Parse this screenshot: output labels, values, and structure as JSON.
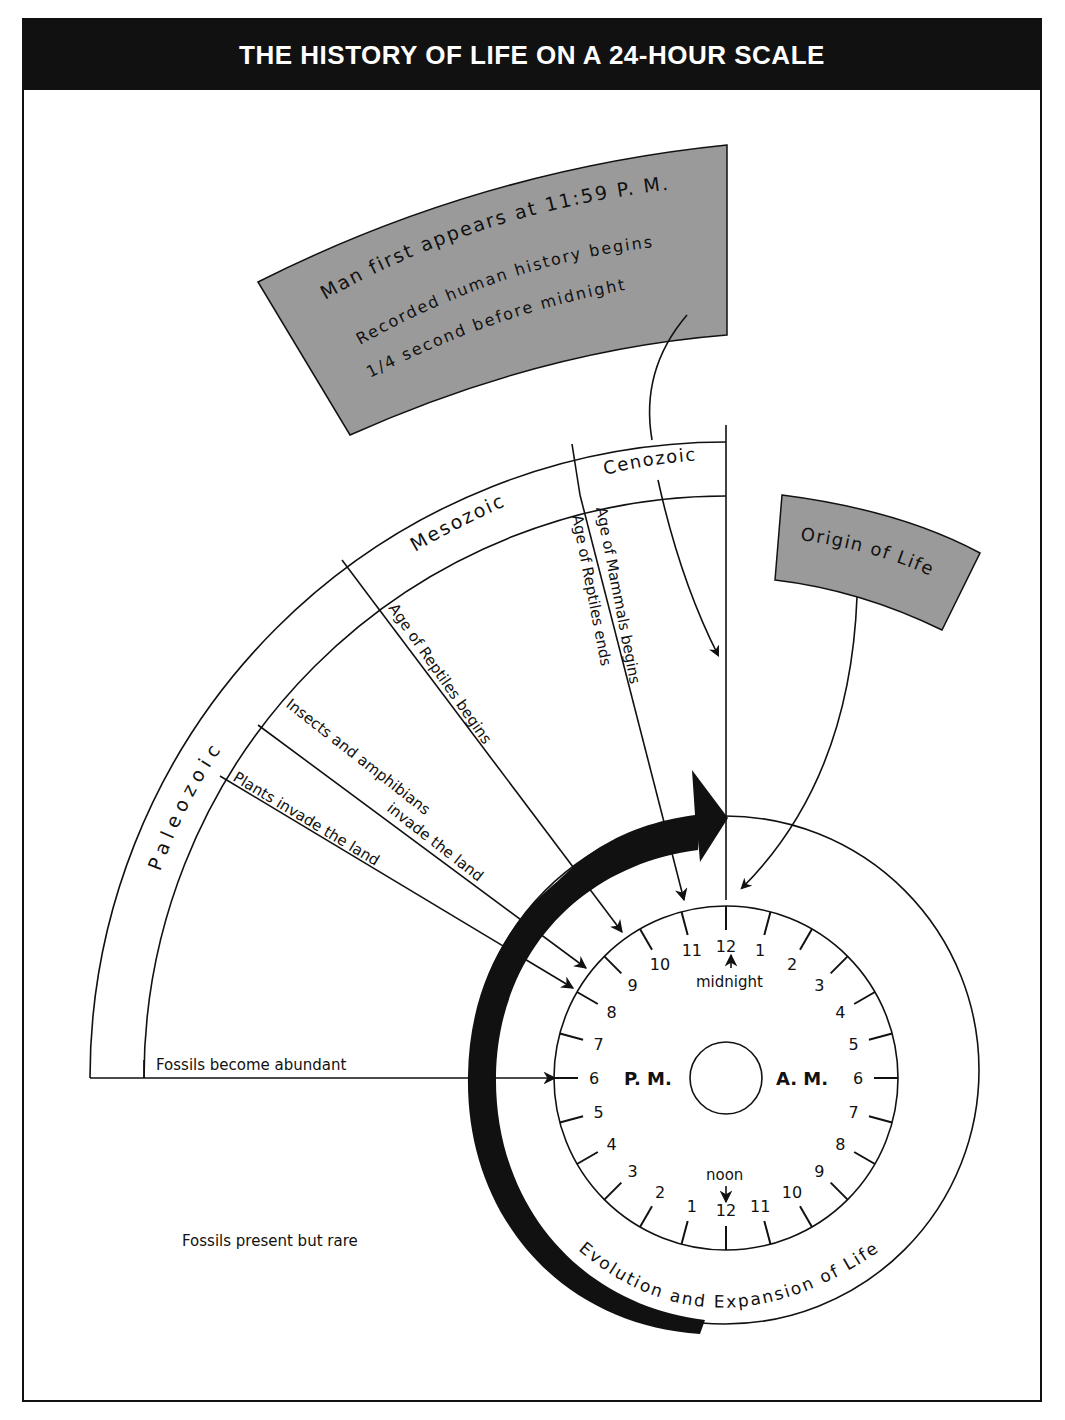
{
  "title": "THE HISTORY OF LIFE ON A 24-HOUR SCALE",
  "callouts": {
    "man": {
      "line1": "Man first appears at 11:59 P. M.",
      "line2": "Recorded human history begins",
      "line3": "1/4  second  before  midnight",
      "fill": "#9a9a9a"
    },
    "origin": {
      "label": "Origin of Life",
      "fill": "#9a9a9a"
    }
  },
  "eras": [
    {
      "name": "Paleozoic"
    },
    {
      "name": "Mesozoic"
    },
    {
      "name": "Cenozoic"
    }
  ],
  "events": {
    "mammals": "Age of Mammals begins",
    "reptiles_end": "Age of Reptiles ends",
    "reptiles_begin": "Age of Reptiles begins",
    "insects_1": "Insects and amphibians",
    "insects_2": "invade the land",
    "plants": "Plants invade the land",
    "fossils_abundant": "Fossils become abundant",
    "fossils_rare": "Fossils present but rare"
  },
  "clock": {
    "am_label": "A. M.",
    "pm_label": "P. M.",
    "midnight_label": "midnight",
    "noon_label": "noon",
    "ring_label": "Evolution  and  Expansion  of  Life",
    "right_numbers": [
      "12",
      "1",
      "2",
      "3",
      "4",
      "5",
      "6",
      "7",
      "8",
      "9",
      "10",
      "11"
    ],
    "bottom_left_numbers": [
      "12",
      "1",
      "2",
      "3",
      "4",
      "5",
      "6",
      "7",
      "8",
      "9",
      "10",
      "11"
    ]
  },
  "colors": {
    "ink": "#111111",
    "gray_box": "#9a9a9a",
    "paper": "#ffffff"
  }
}
